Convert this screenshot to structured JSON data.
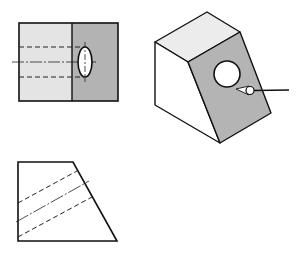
{
  "diagram": {
    "type": "orthographic-and-isometric-projection",
    "views": [
      {
        "id": "front-view",
        "description": "Front view with hole shown as ellipse and hidden lines"
      },
      {
        "id": "isometric-view",
        "description": "Isometric block with inclined face containing a through hole, viewing arrow"
      },
      {
        "id": "side-view",
        "description": "Side view trapezoid with inclined hidden hole lines"
      }
    ],
    "colors": {
      "line": "#111111",
      "light_face": "#e6e6e6",
      "dark_face": "#b4b4b4",
      "top_face": "#ececec",
      "white_face": "#ffffff",
      "hole": "#ffffff"
    }
  }
}
